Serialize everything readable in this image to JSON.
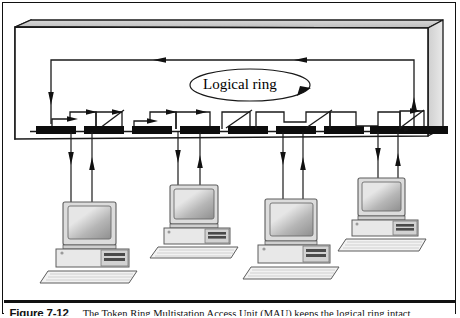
{
  "figure": {
    "number": "Figure 7-12",
    "caption": "The Token Ring Multistation Access Unit (MAU) keeps the logical ring intact",
    "border_color": "#111111",
    "background": "#ffffff"
  },
  "diagram": {
    "type": "network-topology-diagram",
    "ring_label": "Logical ring",
    "chassis": {
      "name": "mau-chassis",
      "description": "3D shaded enclosure representing the Multistation Access Unit",
      "face_color": "#ffffff",
      "top_color": "#d0d0d0",
      "side_color": "#c8c8c8",
      "edge_color": "#1a1a1a"
    },
    "return_path": {
      "name": "ring-return-path",
      "direction": "right-to-left",
      "arrow_count": 2
    },
    "ports": [
      {
        "index": 1,
        "state": "active",
        "label": ""
      },
      {
        "index": 2,
        "state": "bypassed",
        "label": ""
      },
      {
        "index": 3,
        "state": "active",
        "label": ""
      },
      {
        "index": 4,
        "state": "active",
        "label": ""
      },
      {
        "index": 5,
        "state": "bypassed",
        "label": ""
      },
      {
        "index": 6,
        "state": "bypassed",
        "label": ""
      },
      {
        "index": 7,
        "state": "bypassed",
        "label": ""
      },
      {
        "index": 8,
        "state": "bypassed",
        "label": ""
      },
      {
        "index": 9,
        "state": "bypassed",
        "label": ""
      },
      {
        "index": 10,
        "state": "active",
        "label": ""
      }
    ],
    "stations": [
      {
        "index": 1,
        "name": "workstation-1",
        "label": ""
      },
      {
        "index": 2,
        "name": "workstation-2",
        "label": ""
      },
      {
        "index": 3,
        "name": "workstation-3",
        "label": ""
      },
      {
        "index": 4,
        "name": "workstation-4",
        "label": ""
      }
    ],
    "colors": {
      "line": "#1a1a1a",
      "port_block": "#0d0d0d",
      "monitor_bezel": "#d9d9d9",
      "monitor_screen": "#a9a9a9",
      "case_body": "#e4e4e4",
      "keyboard": "#efefef"
    }
  }
}
